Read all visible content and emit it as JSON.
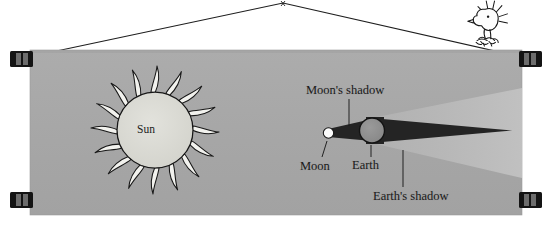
{
  "illustration": {
    "title": "Lunar eclipse diagram on a hanging banner",
    "panel": {
      "background_color": "#a8a8a8",
      "border_color": "#8f8f8f"
    },
    "labels": {
      "sun": "Sun",
      "moon": "Moon",
      "earth": "Earth",
      "moons_shadow": "Moon's shadow",
      "earths_shadow": "Earth's shadow"
    },
    "bodies": [
      {
        "name": "sun",
        "label": "Sun",
        "fill": "#d8d8d2",
        "stroke": "#1a1a1a"
      },
      {
        "name": "moon",
        "label": "Moon",
        "fill": "#fbfbfb",
        "stroke": "#1a1a1a"
      },
      {
        "name": "earth",
        "label": "Earth",
        "fill": "#909090",
        "stroke": "#141414"
      }
    ],
    "shadows": [
      {
        "name": "moons-shadow-umbra",
        "fill": "#242424"
      },
      {
        "name": "earths-shadow-umbra",
        "fill": "#242424"
      },
      {
        "name": "earths-shadow-penumbra",
        "fill": "#bcbcbc"
      }
    ],
    "hardware": {
      "clip_label": "banner-clip",
      "clip_count": 4,
      "clip_color": "#141414",
      "wire_color": "#1e1e1e"
    },
    "character": {
      "name": "woodstock-bird",
      "description": "small bird perched on the hanging wire",
      "body_color": "#fdfdfd",
      "outline_color": "#151515"
    }
  }
}
